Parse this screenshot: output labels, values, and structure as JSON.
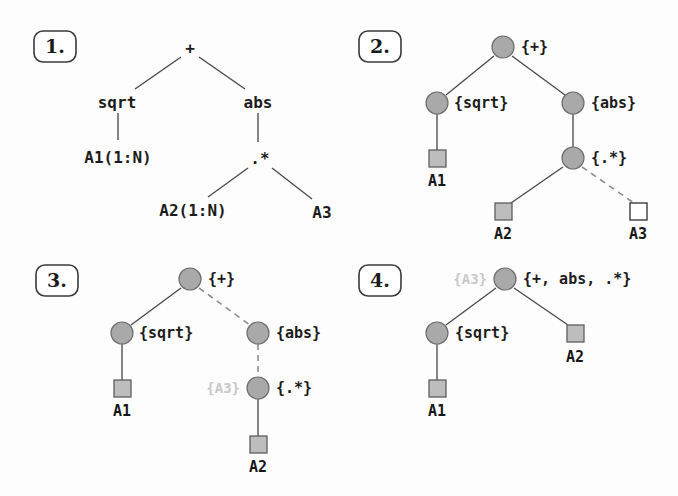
{
  "figure": {
    "title": "",
    "background_color": "#fdfdfd",
    "node_fill_color": "#a9a9a9",
    "node_stroke_color": "#6e6e6e",
    "square_fill_color": "#bdbdbd",
    "open_square_fill_color": "#ffffff",
    "edge_solid_color": "#4a4a4a",
    "edge_dashed_color": "#8d8d8d",
    "ghost_text_color": "#c9c9c9"
  },
  "panels": [
    {
      "badge": "1.",
      "nodes": {
        "root": "+",
        "left": "sqrt",
        "right": "abs",
        "left_leaf": "A1(1:N)",
        "right_op": ".*",
        "right_leaf_1": "A2(1:N)",
        "right_leaf_2": "A3"
      }
    },
    {
      "badge": "2.",
      "nodes": {
        "root": "{+}",
        "left": "{sqrt}",
        "right": "{abs}",
        "right_op": "{.*}",
        "left_leaf": "A1",
        "right_leaf_1": "A2",
        "right_leaf_2": "A3"
      }
    },
    {
      "badge": "3.",
      "nodes": {
        "root": "{+}",
        "left": "{sqrt}",
        "right": "{abs}",
        "right_op": "{.*}",
        "ghost": "{A3}",
        "left_leaf": "A1",
        "right_leaf_1": "A2"
      }
    },
    {
      "badge": "4.",
      "nodes": {
        "root": "{+, abs, .*}",
        "ghost": "{A3}",
        "left": "{sqrt}",
        "left_leaf": "A1",
        "right_leaf": "A2"
      }
    }
  ]
}
